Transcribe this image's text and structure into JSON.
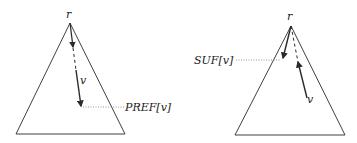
{
  "diagrams": [
    {
      "name": "prefix-tree",
      "root_label": "r",
      "node_label": "v",
      "pointer_label": "PREF[v]",
      "description": "Path from root r down to v; PREF[v] points at v's position"
    },
    {
      "name": "suffix-tree",
      "root_label": "r",
      "node_label": "v",
      "pointer_label": "SUF[v]",
      "description": "Path from root r to v; SUF[v] points at a node on the branch"
    }
  ],
  "colors": {
    "stroke": "#2a2a2a",
    "dotted": "#8a8a8a",
    "background": "#ffffff"
  }
}
